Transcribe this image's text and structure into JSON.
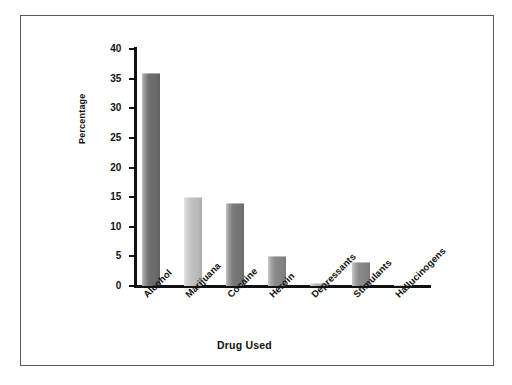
{
  "figure": {
    "border_color": "#5a5a5a",
    "background": "#ffffff"
  },
  "chart_data": {
    "type": "bar",
    "title": "",
    "xlabel": "Drug Used",
    "ylabel": "Percentage",
    "categories": [
      "Alcohol",
      "Marijuana",
      "Cocaine",
      "Heroin",
      "Depressants",
      "Stimulants",
      "Hallucinogens"
    ],
    "values": [
      36,
      15,
      14,
      5,
      0.5,
      4,
      0.2
    ],
    "bar_colors": [
      "#6f6f6f",
      "#c2c2c2",
      "#797979",
      "#8a8a8a",
      "#b0b0b0",
      "#8a8a8a",
      "#9a9a9a"
    ],
    "ylim": [
      0,
      40
    ],
    "yticks": [
      0,
      5,
      10,
      15,
      20,
      25,
      30,
      35,
      40
    ],
    "ytick_labels": [
      "0",
      "5",
      "10",
      "15",
      "20",
      "25",
      "30",
      "35",
      "40"
    ],
    "grid": false,
    "legend": "none",
    "xtick_rotation": 45
  }
}
